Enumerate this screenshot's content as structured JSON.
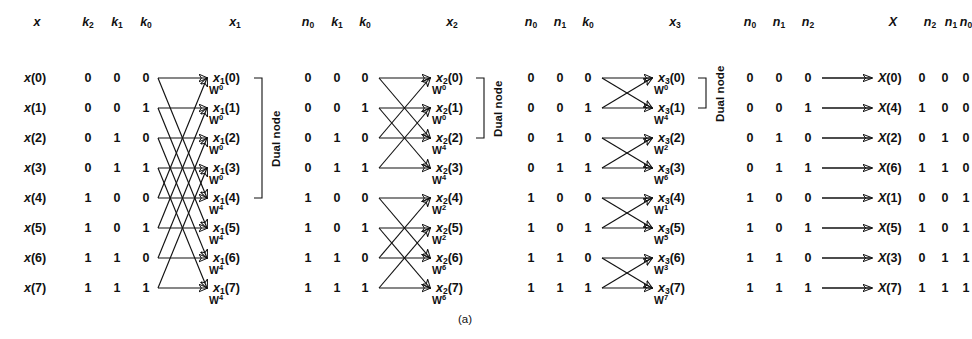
{
  "figure": {
    "caption": "(a)",
    "dual_node_label": "Dual node"
  },
  "headers": [
    {
      "name": "x",
      "sub": ""
    },
    {
      "name": "k",
      "sub": "2"
    },
    {
      "name": "k",
      "sub": "1"
    },
    {
      "name": "k",
      "sub": "0"
    },
    {
      "name": "x",
      "sub": "1"
    },
    {
      "name": "n",
      "sub": "0"
    },
    {
      "name": "k",
      "sub": "1"
    },
    {
      "name": "k",
      "sub": "0"
    },
    {
      "name": "x",
      "sub": "2"
    },
    {
      "name": "n",
      "sub": "0"
    },
    {
      "name": "n",
      "sub": "1"
    },
    {
      "name": "k",
      "sub": "0"
    },
    {
      "name": "x",
      "sub": "3"
    },
    {
      "name": "n",
      "sub": "0"
    },
    {
      "name": "n",
      "sub": "1"
    },
    {
      "name": "n",
      "sub": "2"
    },
    {
      "name": "X",
      "sub": ""
    },
    {
      "name": "n",
      "sub": "2"
    },
    {
      "name": "n",
      "sub": "1"
    },
    {
      "name": "n",
      "sub": "0"
    }
  ],
  "columns": {
    "input_labels": [
      "x(0)",
      "x(1)",
      "x(2)",
      "x(3)",
      "x(4)",
      "x(5)",
      "x(6)",
      "x(7)"
    ],
    "input_bits": [
      [
        "0",
        "0",
        "0"
      ],
      [
        "0",
        "0",
        "1"
      ],
      [
        "0",
        "1",
        "0"
      ],
      [
        "0",
        "1",
        "1"
      ],
      [
        "1",
        "0",
        "0"
      ],
      [
        "1",
        "0",
        "1"
      ],
      [
        "1",
        "1",
        "0"
      ],
      [
        "1",
        "1",
        "1"
      ]
    ],
    "stage1_out_labels": [
      "x1(0)",
      "x1(1)",
      "x1(2)",
      "x1(3)",
      "x1(4)",
      "x1(5)",
      "x1(6)",
      "x1(7)"
    ],
    "stage1_w": [
      "0",
      "0",
      "0",
      "0",
      "4",
      "4",
      "4",
      "4"
    ],
    "stage2_in_bits": [
      [
        "0",
        "0",
        "0"
      ],
      [
        "0",
        "0",
        "1"
      ],
      [
        "0",
        "1",
        "0"
      ],
      [
        "0",
        "1",
        "1"
      ],
      [
        "1",
        "0",
        "0"
      ],
      [
        "1",
        "0",
        "1"
      ],
      [
        "1",
        "1",
        "0"
      ],
      [
        "1",
        "1",
        "1"
      ]
    ],
    "stage2_out_labels": [
      "x2(0)",
      "x2(1)",
      "x2(2)",
      "x2(3)",
      "x2(4)",
      "x2(5)",
      "x2(6)",
      "x2(7)"
    ],
    "stage2_w": [
      "0",
      "0",
      "4",
      "4",
      "2",
      "2",
      "6",
      "6"
    ],
    "stage3_in_bits": [
      [
        "0",
        "0",
        "0"
      ],
      [
        "0",
        "0",
        "1"
      ],
      [
        "0",
        "1",
        "0"
      ],
      [
        "0",
        "1",
        "1"
      ],
      [
        "1",
        "0",
        "0"
      ],
      [
        "1",
        "0",
        "1"
      ],
      [
        "1",
        "1",
        "0"
      ],
      [
        "1",
        "1",
        "1"
      ]
    ],
    "stage3_out_labels": [
      "x3(0)",
      "x3(1)",
      "x3(2)",
      "x3(3)",
      "x3(4)",
      "x3(5)",
      "x3(6)",
      "x3(7)"
    ],
    "stage3_w": [
      "0",
      "4",
      "2",
      "6",
      "1",
      "5",
      "3",
      "7"
    ],
    "stage4_in_bits": [
      [
        "0",
        "0",
        "0"
      ],
      [
        "0",
        "0",
        "1"
      ],
      [
        "0",
        "1",
        "0"
      ],
      [
        "0",
        "1",
        "1"
      ],
      [
        "1",
        "0",
        "0"
      ],
      [
        "1",
        "0",
        "1"
      ],
      [
        "1",
        "1",
        "0"
      ],
      [
        "1",
        "1",
        "1"
      ]
    ],
    "output_labels": [
      "X(0)",
      "X(4)",
      "X(2)",
      "X(6)",
      "X(1)",
      "X(5)",
      "X(3)",
      "X(7)"
    ],
    "output_bits": [
      [
        "0",
        "0",
        "0"
      ],
      [
        "1",
        "0",
        "0"
      ],
      [
        "0",
        "1",
        "0"
      ],
      [
        "1",
        "1",
        "0"
      ],
      [
        "0",
        "0",
        "1"
      ],
      [
        "1",
        "0",
        "1"
      ],
      [
        "0",
        "1",
        "1"
      ],
      [
        "1",
        "1",
        "1"
      ]
    ]
  },
  "dual_node_brackets": [
    {
      "stage": 1,
      "from_row": 0,
      "to_row": 4
    },
    {
      "stage": 2,
      "from_row": 0,
      "to_row": 2
    },
    {
      "stage": 3,
      "from_row": 0,
      "to_row": 1
    }
  ],
  "colors": {
    "ink": "#111111",
    "paper": "#ffffff"
  }
}
